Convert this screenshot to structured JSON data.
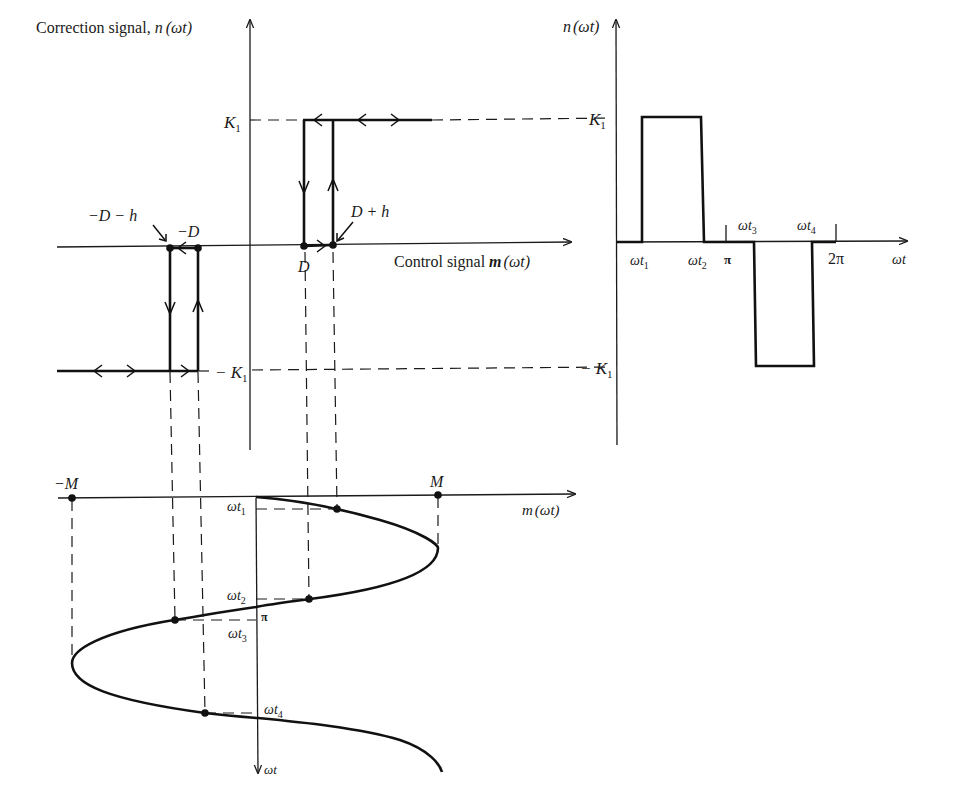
{
  "hysteresis_plot": {
    "y_axis_label": "Correction signal, n(ωt)",
    "x_axis_label": "Control signal m(ωt)",
    "levels": {
      "upper": "K₁",
      "lower": "−K₁"
    },
    "x_points": [
      {
        "label": "−D − h",
        "role": "switch-down threshold (negative)"
      },
      {
        "label": "−D",
        "role": "release threshold (negative)"
      },
      {
        "label": "D",
        "role": "release threshold (positive)"
      },
      {
        "label": "D + h",
        "role": "switch-up threshold (positive)"
      }
    ],
    "labels": {
      "k1": "K",
      "k1_sub": "1",
      "neg_k1": "− K",
      "neg_k1_sub": "1",
      "neg_d_minus_h": "−D − h",
      "neg_d": "−D",
      "d": "D",
      "d_plus_h": "D + h",
      "y_axis_prefix": "Correction signal, ",
      "y_axis_fn": "n",
      "y_axis_arg": "(ωt)",
      "x_axis_prefix": "Control signal ",
      "x_axis_fn": "m",
      "x_axis_arg": "(ωt)"
    }
  },
  "output_waveform_plot": {
    "y_axis_label": "n(ωt)",
    "x_axis_label": "ωt",
    "labels": {
      "y_fn": "n",
      "y_arg": "(ωt)",
      "k1": "K",
      "k1_sub": "1",
      "neg_k1": "− K",
      "neg_k1_sub": "1",
      "wt1": "ωt",
      "wt1_sub": "1",
      "wt2": "ωt",
      "wt2_sub": "2",
      "pi": "π",
      "wt3": "ωt",
      "wt3_sub": "3",
      "wt4": "ωt",
      "wt4_sub": "4",
      "two_pi": "2π",
      "x_axis": "ωt"
    },
    "segments": [
      {
        "from": "0",
        "to": "ωt₁",
        "value": "0"
      },
      {
        "from": "ωt₁",
        "to": "ωt₂",
        "value": "K₁"
      },
      {
        "from": "ωt₂",
        "to": "ωt₃",
        "value": "0"
      },
      {
        "from": "ωt₃",
        "to": "ωt₄",
        "value": "−K₁"
      },
      {
        "from": "ωt₄",
        "to": "2π",
        "value": "0"
      }
    ]
  },
  "input_sinusoid_plot": {
    "x_axis_label": "m(ωt)",
    "time_axis_label": "ωt",
    "labels": {
      "neg_m": "−M",
      "m": "M",
      "x_fn": "m",
      "x_arg": "(ωt)",
      "wt1": "ωt",
      "wt1_sub": "1",
      "wt2": "ωt",
      "wt2_sub": "2",
      "pi": "π",
      "wt3": "ωt",
      "wt3_sub": "3",
      "wt4": "ωt",
      "wt4_sub": "4",
      "time_axis": "ωt"
    },
    "amplitude": "M"
  }
}
